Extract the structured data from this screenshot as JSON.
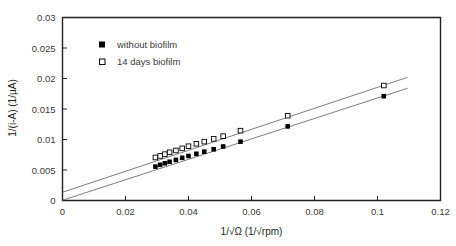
{
  "chart_data": {
    "type": "scatter",
    "title": "",
    "xlabel": "1/√Ω  (1/√rpm)",
    "ylabel": "1/(i-A)   (1/µA)",
    "xlim": [
      0,
      0.12
    ],
    "ylim": [
      0,
      0.03
    ],
    "xticks": [
      0,
      0.02,
      0.04,
      0.06,
      0.08,
      0.1,
      0.12
    ],
    "xtick_labels": [
      "0",
      "0.02",
      "0.04",
      "0.06",
      "0.08",
      "0.1",
      "0.12"
    ],
    "yticks": [
      0,
      0.005,
      0.01,
      0.015,
      0.02,
      0.025,
      0.03
    ],
    "ytick_labels": [
      "0",
      "0.005",
      "0.01",
      "0.015",
      "0.02",
      "0.025",
      "0.03"
    ],
    "grid": false,
    "legend_position": "upper-left-inside",
    "series": [
      {
        "name": "without biofilm",
        "marker": "filled-square",
        "color": "#000000",
        "x": [
          0.0295,
          0.031,
          0.0325,
          0.034,
          0.036,
          0.038,
          0.04,
          0.0425,
          0.045,
          0.048,
          0.051,
          0.0565,
          0.0715,
          0.102
        ],
        "y": [
          0.00555,
          0.00585,
          0.0061,
          0.00635,
          0.00665,
          0.007,
          0.0073,
          0.00765,
          0.008,
          0.0084,
          0.00885,
          0.00965,
          0.01215,
          0.0171
        ],
        "fit_line": {
          "intercept": 5e-05,
          "slope": 0.1675
        }
      },
      {
        "name": "14 days biofilm",
        "marker": "open-square",
        "color": "#000000",
        "x": [
          0.0295,
          0.031,
          0.0325,
          0.034,
          0.036,
          0.038,
          0.04,
          0.0425,
          0.045,
          0.048,
          0.051,
          0.0565,
          0.0715,
          0.102
        ],
        "y": [
          0.00705,
          0.0073,
          0.0076,
          0.0079,
          0.0082,
          0.00855,
          0.0089,
          0.0093,
          0.00965,
          0.0101,
          0.01055,
          0.01145,
          0.0139,
          0.01885
        ],
        "fit_line": {
          "intercept": 0.00135,
          "slope": 0.172
        }
      }
    ]
  },
  "legend": {
    "entries": [
      {
        "label": "without biofilm",
        "marker": "filled-square"
      },
      {
        "label": "14 days biofilm",
        "marker": "open-square"
      }
    ]
  }
}
